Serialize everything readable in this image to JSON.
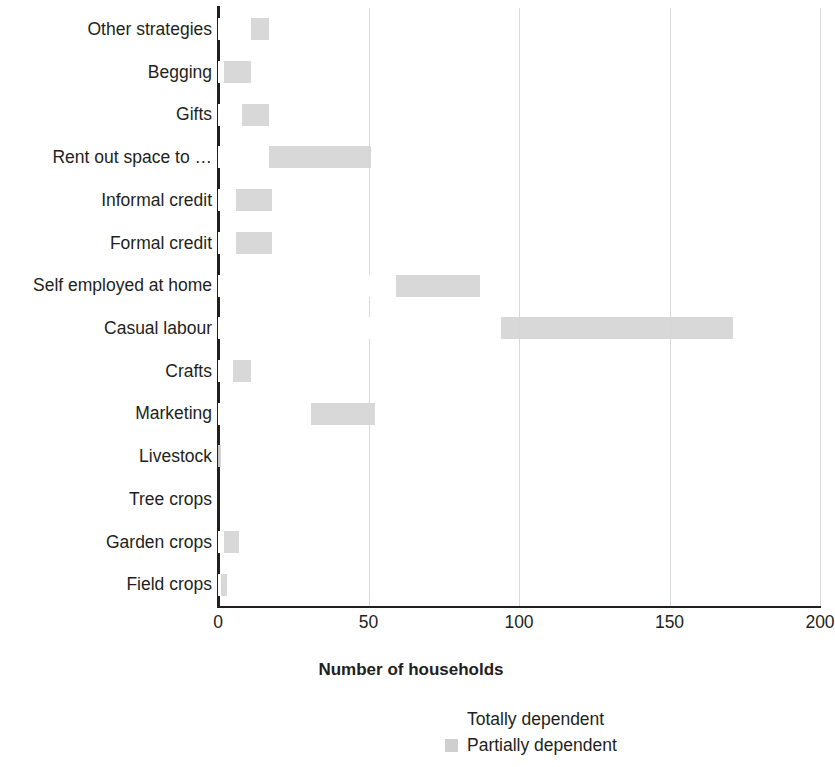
{
  "chart_data": {
    "type": "bar",
    "orientation": "horizontal",
    "stacked": true,
    "title": "",
    "xlabel": "Number of households",
    "ylabel": "",
    "xlim": [
      0,
      200
    ],
    "xticks": [
      0,
      50,
      100,
      150,
      200
    ],
    "xtick_labels": [
      "0",
      "50",
      "100",
      "150",
      "200"
    ],
    "grid": "vertical",
    "legend_position": "bottom",
    "categories": [
      "Other strategies",
      "Begging",
      "Gifts",
      "Rent out space to …",
      "Informal credit",
      "Formal credit",
      "Self employed at home",
      "Casual labour",
      "Crafts",
      "Marketing",
      "Livestock",
      "Tree crops",
      "Garden crops",
      "Field crops"
    ],
    "series": [
      {
        "name": "Totally dependent",
        "color": "#ffffff",
        "values": [
          11,
          2,
          8,
          17,
          6,
          6,
          59,
          94,
          5,
          31,
          0,
          0,
          2,
          1
        ]
      },
      {
        "name": "Partially dependent",
        "color": "#d5d5d5",
        "values": [
          6,
          9,
          9,
          34,
          12,
          12,
          28,
          77,
          6,
          21,
          1,
          0,
          5,
          2
        ]
      }
    ]
  },
  "axis": {
    "x_title": "Number of households"
  },
  "legend": {
    "entries": [
      {
        "label": "Totally dependent",
        "swatch": "totally"
      },
      {
        "label": "Partially dependent",
        "swatch": "partially"
      }
    ]
  }
}
